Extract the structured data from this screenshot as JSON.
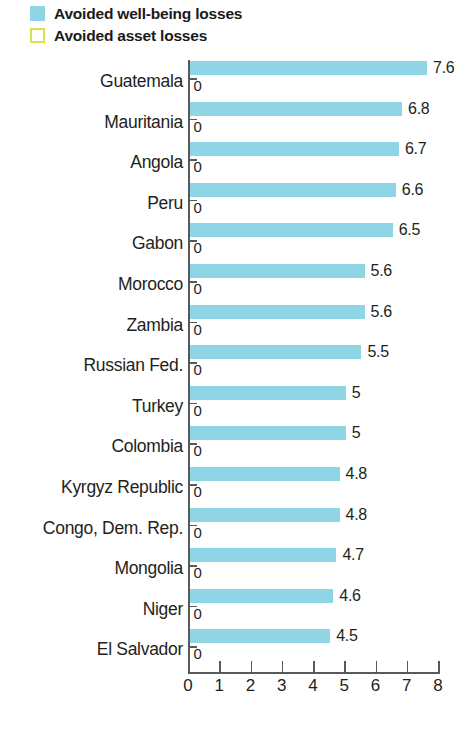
{
  "legend": {
    "items": [
      {
        "label": "Avoided well-being losses",
        "style": "filled",
        "color": "#8fd5e6",
        "icon": "legend-swatch-filled"
      },
      {
        "label": "Avoided asset losses",
        "style": "outline",
        "color": "#d9e24c",
        "icon": "legend-swatch-outline"
      }
    ]
  },
  "axis": {
    "title": "Percent of current losses",
    "ticks": [
      "0",
      "1",
      "2",
      "3",
      "4",
      "5",
      "6",
      "7",
      "8"
    ]
  },
  "chart_data": {
    "type": "bar",
    "orientation": "horizontal",
    "title": "",
    "subtitle": "",
    "xlabel": "Percent of current losses",
    "ylabel": "",
    "xlim": [
      0,
      8
    ],
    "xticks": [
      0,
      1,
      2,
      3,
      4,
      5,
      6,
      7,
      8
    ],
    "grid": false,
    "legend_position": "top-left",
    "categories": [
      "Guatemala",
      "Mauritania",
      "Angola",
      "Peru",
      "Gabon",
      "Morocco",
      "Zambia",
      "Russian Fed.",
      "Turkey",
      "Colombia",
      "Kyrgyz Republic",
      "Congo, Dem. Rep.",
      "Mongolia",
      "Niger",
      "El Salvador"
    ],
    "series": [
      {
        "name": "Avoided well-being losses",
        "color": "#8fd5e6",
        "values": [
          7.6,
          6.8,
          6.7,
          6.6,
          6.5,
          5.6,
          5.6,
          5.5,
          5,
          5,
          4.8,
          4.8,
          4.7,
          4.6,
          4.5
        ],
        "labels": [
          "7.6",
          "6.8",
          "6.7",
          "6.6",
          "6.5",
          "5.6",
          "5.6",
          "5.5",
          "5",
          "5",
          "4.8",
          "4.8",
          "4.7",
          "4.6",
          "4.5"
        ]
      },
      {
        "name": "Avoided asset losses",
        "color": "#ffffff",
        "values": [
          0,
          0,
          0,
          0,
          0,
          0,
          0,
          0,
          0,
          0,
          0,
          0,
          0,
          0,
          0
        ],
        "labels": [
          "0",
          "0",
          "0",
          "0",
          "0",
          "0",
          "0",
          "0",
          "0",
          "0",
          "0",
          "0",
          "0",
          "0",
          "0"
        ]
      }
    ]
  }
}
